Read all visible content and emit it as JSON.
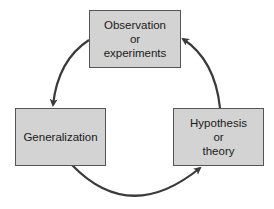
{
  "diagram": {
    "type": "cycle",
    "nodes": [
      {
        "id": "observation",
        "lines": [
          "Observation",
          "or",
          "experiments"
        ]
      },
      {
        "id": "generalization",
        "lines": [
          "Generalization"
        ]
      },
      {
        "id": "hypothesis",
        "lines": [
          "Hypothesis",
          "or",
          "theory"
        ]
      }
    ],
    "edges": [
      {
        "from": "observation",
        "to": "generalization"
      },
      {
        "from": "generalization",
        "to": "hypothesis"
      },
      {
        "from": "hypothesis",
        "to": "observation"
      }
    ],
    "colors": {
      "box_fill": "#d3d3d3",
      "box_border": "#555555",
      "arrow": "#3a3a3a"
    }
  }
}
